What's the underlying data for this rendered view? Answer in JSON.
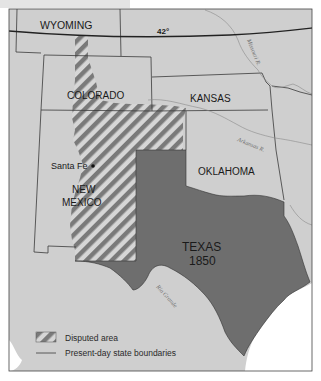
{
  "map": {
    "states": {
      "wyoming": "WYOMING",
      "colorado": "COLORADO",
      "kansas": "KANSAS",
      "oklahoma": "OKLAHOMA",
      "new_mexico_line1": "NEW",
      "new_mexico_line2": "MEXICO",
      "texas": "TEXAS",
      "texas_year": "1850"
    },
    "cities": {
      "santa_fe": "Santa Fe"
    },
    "latitude_label": "42°",
    "rivers": {
      "missouri": "Missouri R.",
      "arkansas": "Arkansas R.",
      "rio_grande": "Rio Grande"
    },
    "legend": {
      "disputed_label": "Disputed area",
      "boundaries_label": "Present-day state boundaries"
    },
    "colors": {
      "land": "#cfcfcf",
      "texas": "#6e6e6e",
      "hatch_dark": "#777777",
      "hatch_light": "#d6d6d6",
      "boundary": "#3a3a3a",
      "latitude_line": "#222222",
      "water": "#ffffff"
    }
  }
}
